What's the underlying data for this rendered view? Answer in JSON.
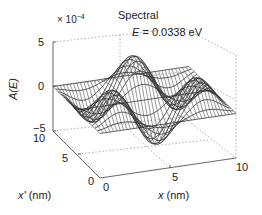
{
  "chart_data": {
    "type": "surface3d",
    "title": "Spectral",
    "annotation": "E = 0.0338 eV",
    "annotation_var": "E",
    "annotation_value": "= 0.0338 eV",
    "zlabel": "A(E)",
    "zlabel_var": "A(E)",
    "xlabel": "x (nm)",
    "xlabel_var": "x",
    "xlabel_unit": "(nm)",
    "ylabel": "x' (nm)",
    "ylabel_var": "x'",
    "ylabel_unit": "(nm)",
    "z_multiplier": "× 10",
    "z_multiplier_exp": "−4",
    "xlim": [
      0,
      10
    ],
    "ylim": [
      0,
      10
    ],
    "zlim": [
      -0.0005,
      0.0005
    ],
    "x_ticks": [
      "0",
      "5",
      "10"
    ],
    "y_ticks": [
      "0",
      "5",
      "10"
    ],
    "z_ticks": [
      "5",
      "0",
      "−5"
    ],
    "grid": "dotted box edges",
    "surface_description": "Oscillatory mesh surface with positive peaks (~+4e-4) near (x≈2,x'≈9), (x≈5,x'≈9) and (x≈9,x'≈7) and negative troughs (~-4e-4) near (x≈4,x'≈5) and (x≈6,x'≈3); value ~0 along edges",
    "colors": {
      "mesh_line": "#111111",
      "mesh_fill": "#8a8a8a",
      "axis": "#555555",
      "grid": "#999999"
    }
  }
}
